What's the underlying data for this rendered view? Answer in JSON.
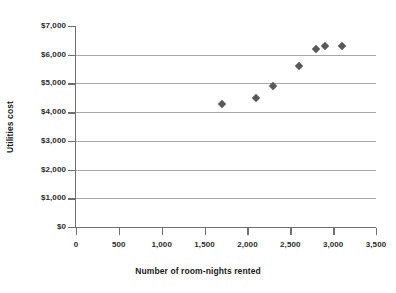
{
  "chart_data": {
    "type": "scatter",
    "title": "",
    "xlabel": "Number of room-nights rented",
    "ylabel": "Utilities cost",
    "xlim": [
      0,
      3500
    ],
    "ylim": [
      0,
      7000
    ],
    "grid": true,
    "legend": "none",
    "marker": "diamond",
    "marker_color": "#595959",
    "gridline_color": "#a9a9a9",
    "axis_color": "#6e6e6e",
    "x_tick_labels": [
      "0",
      "500",
      "1,000",
      "1,500",
      "2,000",
      "2,500",
      "3,000",
      "3,500"
    ],
    "x_tick_values": [
      0,
      500,
      1000,
      1500,
      2000,
      2500,
      3000,
      3500
    ],
    "y_tick_labels": [
      "$0",
      "$1,000",
      "$2,000",
      "$3,000",
      "$4,000",
      "$5,000",
      "$6,000",
      "$7,000"
    ],
    "y_tick_values": [
      0,
      1000,
      2000,
      3000,
      4000,
      5000,
      6000,
      7000
    ],
    "points": [
      {
        "x": 1700,
        "y": 4300
      },
      {
        "x": 2100,
        "y": 4500
      },
      {
        "x": 2300,
        "y": 4900
      },
      {
        "x": 2600,
        "y": 5600
      },
      {
        "x": 2800,
        "y": 6200
      },
      {
        "x": 2900,
        "y": 6300
      },
      {
        "x": 3100,
        "y": 6300
      }
    ]
  }
}
